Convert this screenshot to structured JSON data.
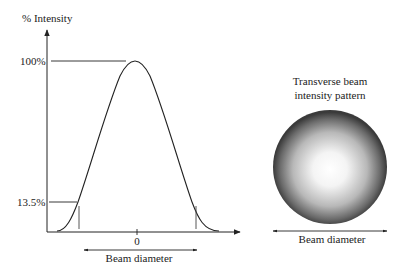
{
  "graph": {
    "y_axis_label": "% Intensity",
    "peak_label": "100%",
    "threshold_label": "13.5%",
    "x_origin_label": "0",
    "x_axis_label": "Beam diameter"
  },
  "pattern": {
    "title_line1": "Transverse beam",
    "title_line2": "intensity pattern",
    "diameter_label": "Beam diameter"
  },
  "colors": {
    "line": "#222222",
    "spot_center": "#ffffff",
    "spot_edge": "#3a3a3a"
  }
}
